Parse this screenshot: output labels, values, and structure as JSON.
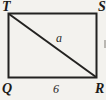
{
  "figure": {
    "type": "geometry-diagram",
    "shape": "rectangle with diagonal",
    "vertices": {
      "top_left": "T",
      "top_right": "S",
      "bottom_left": "Q",
      "bottom_right": "R"
    },
    "labels": {
      "diagonal": "a",
      "base": "6"
    },
    "colors": {
      "line": "#232220",
      "background": "#f3f2ee",
      "text": "#1c1b19"
    }
  }
}
